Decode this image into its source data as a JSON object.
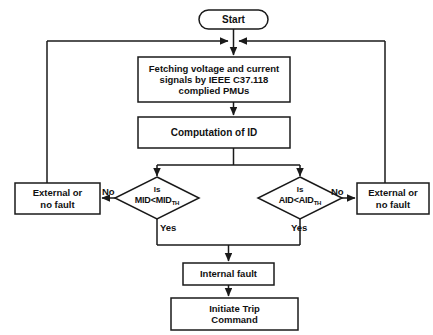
{
  "diagram": {
    "stroke_color": "#1a1a1a",
    "background_color": "#ffffff",
    "nodes": {
      "start": {
        "label": "Start",
        "shape": "terminator"
      },
      "fetch": {
        "label": "Fetching voltage and current\nsignals by IEEE C37.118\ncomplied PMUs",
        "shape": "process"
      },
      "compute": {
        "label": "Computation of ID",
        "shape": "process"
      },
      "decision_mid": {
        "line1": "Is",
        "metric": "MID<MID",
        "subscript": "TH",
        "shape": "decision"
      },
      "decision_aid": {
        "line1": "Is",
        "metric": "AID<AID",
        "subscript": "TH",
        "shape": "decision"
      },
      "external_left": {
        "label": "External or\nno fault",
        "shape": "process"
      },
      "external_right": {
        "label": "External or\nno fault",
        "shape": "process"
      },
      "internal_fault": {
        "label": "Internal fault",
        "shape": "process"
      },
      "trip": {
        "label": "Initiate Trip\nCommand",
        "shape": "process"
      }
    },
    "edge_labels": {
      "mid_no": "No",
      "mid_yes": "Yes",
      "aid_no": "No",
      "aid_yes": "Yes"
    }
  }
}
